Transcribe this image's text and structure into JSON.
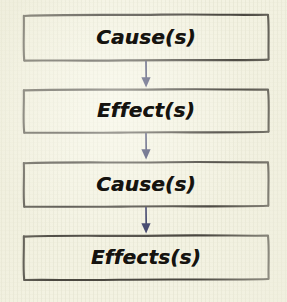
{
  "diagram": {
    "type": "flowchart-vertical",
    "background_color": "#f3f2e2",
    "box_border_color": "#4a4740",
    "text_color": "#15130f",
    "arrow_color": "#363a63",
    "nodes": [
      {
        "id": "node-1",
        "label": "Cause(s)"
      },
      {
        "id": "node-2",
        "label": "Effect(s)"
      },
      {
        "id": "node-3",
        "label": "Cause(s)"
      },
      {
        "id": "node-4",
        "label": "Effects(s)"
      }
    ],
    "connectors": [
      {
        "id": "arrow-1",
        "from": "node-1",
        "to": "node-2",
        "shape": "down-arrow"
      },
      {
        "id": "arrow-2",
        "from": "node-2",
        "to": "node-3",
        "shape": "down-arrow"
      },
      {
        "id": "arrow-3",
        "from": "node-3",
        "to": "node-4",
        "shape": "down-arrow"
      }
    ]
  }
}
